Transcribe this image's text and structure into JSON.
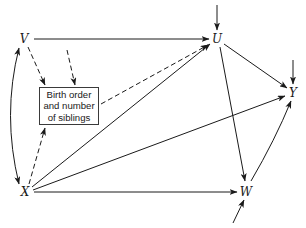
{
  "diagram": {
    "type": "path-diagram",
    "nodes": {
      "V": {
        "label": "V",
        "x": 24,
        "y": 39
      },
      "U": {
        "label": "U",
        "x": 217,
        "y": 39
      },
      "Y": {
        "label": "Y",
        "x": 293,
        "y": 93
      },
      "X": {
        "label": "X",
        "x": 25,
        "y": 192
      },
      "W": {
        "label": "W",
        "x": 246,
        "y": 191
      }
    },
    "box": {
      "lines": [
        "Birth order",
        "and number",
        "of siblings"
      ]
    },
    "edges": [
      {
        "from": "V",
        "to": "U",
        "style": "solid",
        "kind": "directed"
      },
      {
        "from": "V",
        "to": "X",
        "style": "solid",
        "kind": "curved-bidirectional"
      },
      {
        "from": "V",
        "to": "box",
        "style": "dashed",
        "kind": "directed"
      },
      {
        "from": "external",
        "to": "box",
        "style": "dashed",
        "kind": "directed"
      },
      {
        "from": "X",
        "to": "box",
        "style": "dashed",
        "kind": "directed"
      },
      {
        "from": "box",
        "to": "U",
        "style": "dashed",
        "kind": "directed"
      },
      {
        "from": "X",
        "to": "U",
        "style": "solid",
        "kind": "directed"
      },
      {
        "from": "X",
        "to": "Y",
        "style": "solid",
        "kind": "directed"
      },
      {
        "from": "X",
        "to": "W",
        "style": "solid",
        "kind": "directed"
      },
      {
        "from": "U",
        "to": "Y",
        "style": "solid",
        "kind": "directed"
      },
      {
        "from": "U",
        "to": "W",
        "style": "solid",
        "kind": "directed"
      },
      {
        "from": "W",
        "to": "Y",
        "style": "solid",
        "kind": "directed-curved"
      },
      {
        "from": "residual",
        "to": "U",
        "style": "solid",
        "kind": "directed"
      },
      {
        "from": "residual",
        "to": "Y",
        "style": "solid",
        "kind": "directed"
      },
      {
        "from": "residual",
        "to": "W",
        "style": "solid",
        "kind": "directed"
      }
    ],
    "colors": {
      "line": "#1a1a1a",
      "background": "#ffffff"
    }
  }
}
